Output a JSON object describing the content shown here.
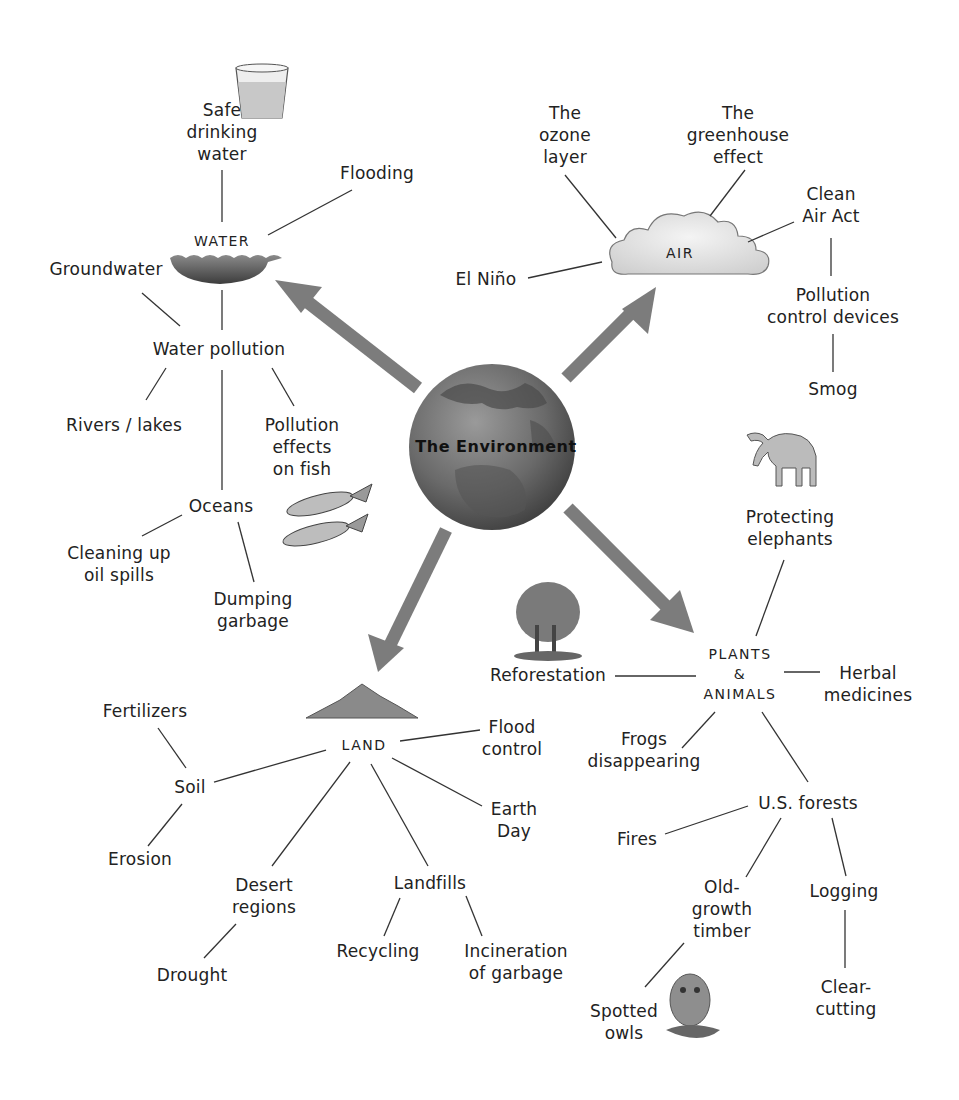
{
  "center": {
    "title": "The Environment"
  },
  "categories": {
    "water": "WATER",
    "air": "AIR",
    "land": "LAND",
    "plants_animals": "PLANTS\n&\nANIMALS"
  },
  "water": {
    "safe_drinking_water": "Safe\ndrinking\nwater",
    "flooding": "Flooding",
    "groundwater": "Groundwater",
    "water_pollution": "Water pollution",
    "rivers_lakes": "Rivers / lakes",
    "pollution_effects_on_fish": "Pollution\neffects\non fish",
    "oceans": "Oceans",
    "cleaning_up_oil_spills": "Cleaning up\noil spills",
    "dumping_garbage": "Dumping\ngarbage"
  },
  "air": {
    "ozone_layer": "The\nozone\nlayer",
    "greenhouse_effect": "The\ngreenhouse\neffect",
    "clean_air_act": "Clean\nAir Act",
    "el_nino": "El Niño",
    "pollution_control_devices": "Pollution\ncontrol devices",
    "smog": "Smog"
  },
  "plants_animals": {
    "protecting_elephants": "Protecting\nelephants",
    "reforestation": "Reforestation",
    "herbal_medicines": "Herbal\nmedicines",
    "frogs_disappearing": "Frogs\ndisappearing",
    "us_forests": "U.S. forests",
    "fires": "Fires",
    "old_growth_timber": "Old-\ngrowth\ntimber",
    "logging": "Logging",
    "spotted_owls": "Spotted\nowls",
    "clear_cutting": "Clear-\ncutting"
  },
  "land": {
    "fertilizers": "Fertilizers",
    "soil": "Soil",
    "erosion": "Erosion",
    "flood_control": "Flood\ncontrol",
    "earth_day": "Earth\nDay",
    "desert_regions": "Desert\nregions",
    "drought": "Drought",
    "landfills": "Landfills",
    "recycling": "Recycling",
    "incineration_of_garbage": "Incineration\nof garbage"
  },
  "colors": {
    "arrow": "#7c7c7c",
    "globe": "#5a5a5a",
    "line": "#333333"
  }
}
